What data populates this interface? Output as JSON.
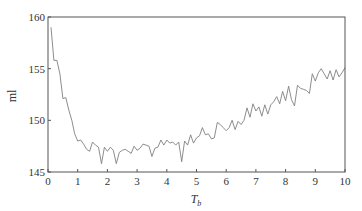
{
  "chart_data": {
    "type": "line",
    "title": "",
    "xlabel": "T",
    "xlabel_sub": "b",
    "ylabel": "ml",
    "xlim": [
      0,
      10
    ],
    "ylim": [
      145,
      160
    ],
    "xticks": [
      0,
      1,
      2,
      3,
      4,
      5,
      6,
      7,
      8,
      9,
      10
    ],
    "yticks": [
      145,
      150,
      155,
      160
    ],
    "grid": false,
    "legend": null,
    "line_color": "#808080",
    "series": [
      {
        "name": "ml",
        "x": [
          0.1,
          0.2,
          0.3,
          0.4,
          0.5,
          0.6,
          0.7,
          0.8,
          0.9,
          1.0,
          1.1,
          1.2,
          1.3,
          1.4,
          1.5,
          1.6,
          1.7,
          1.8,
          1.9,
          2.0,
          2.1,
          2.2,
          2.3,
          2.4,
          2.5,
          2.6,
          2.7,
          2.8,
          2.9,
          3.0,
          3.1,
          3.2,
          3.3,
          3.4,
          3.5,
          3.6,
          3.7,
          3.8,
          3.9,
          4.0,
          4.1,
          4.2,
          4.3,
          4.4,
          4.5,
          4.6,
          4.7,
          4.8,
          4.9,
          5.0,
          5.1,
          5.2,
          5.3,
          5.4,
          5.5,
          5.6,
          5.7,
          5.8,
          5.9,
          6.0,
          6.1,
          6.2,
          6.3,
          6.4,
          6.5,
          6.6,
          6.7,
          6.8,
          6.9,
          7.0,
          7.1,
          7.2,
          7.3,
          7.4,
          7.5,
          7.6,
          7.7,
          7.8,
          7.9,
          8.0,
          8.1,
          8.2,
          8.3,
          8.4,
          8.5,
          8.6,
          8.7,
          8.8,
          8.9,
          9.0,
          9.1,
          9.2,
          9.3,
          9.4,
          9.5,
          9.6,
          9.7,
          9.8,
          9.9,
          10.0
        ],
        "values": [
          159.0,
          155.8,
          155.8,
          154.5,
          152.1,
          152.2,
          151.0,
          150.0,
          148.7,
          148.0,
          148.1,
          147.7,
          147.2,
          147.0,
          147.9,
          147.6,
          147.4,
          145.8,
          147.4,
          147.0,
          147.4,
          147.1,
          145.8,
          146.9,
          147.1,
          147.2,
          147.0,
          146.8,
          147.5,
          147.1,
          147.3,
          147.7,
          147.6,
          147.5,
          146.5,
          147.3,
          147.4,
          148.1,
          147.6,
          148.1,
          147.8,
          147.9,
          147.6,
          147.9,
          146.0,
          148.0,
          147.6,
          148.6,
          147.8,
          148.3,
          148.5,
          149.3,
          148.6,
          148.7,
          148.2,
          148.3,
          149.8,
          149.6,
          149.3,
          149.0,
          149.3,
          150.0,
          149.1,
          149.9,
          149.6,
          150.0,
          151.2,
          150.3,
          151.6,
          150.9,
          151.3,
          150.4,
          151.5,
          150.6,
          151.5,
          151.8,
          152.3,
          151.6,
          152.8,
          151.9,
          153.3,
          152.0,
          151.4,
          153.4,
          153.1,
          153.0,
          152.9,
          152.6,
          154.5,
          153.8,
          154.6,
          155.0,
          154.5,
          154.0,
          154.8,
          153.9,
          154.9,
          154.2,
          154.6,
          155.1
        ]
      }
    ]
  }
}
